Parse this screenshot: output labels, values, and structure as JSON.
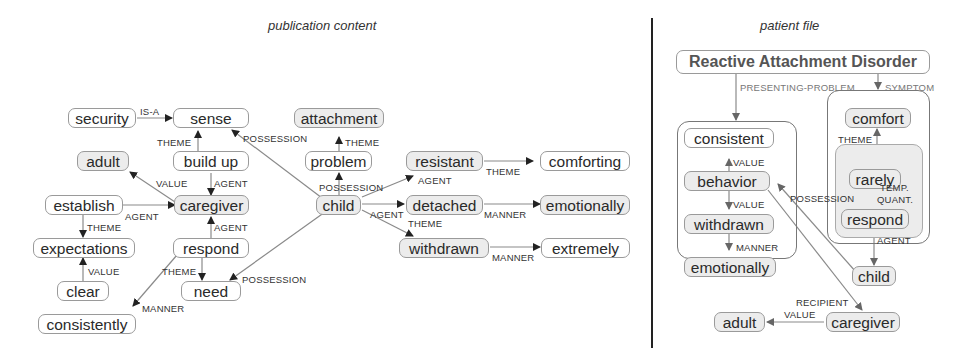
{
  "titles": {
    "left": "publication content",
    "right": "patient file"
  },
  "left_graph": {
    "nodes": {
      "security": "security",
      "sense": "sense",
      "attachment": "attachment",
      "adult": "adult",
      "build_up": "build up",
      "problem": "problem",
      "establish": "establish",
      "caregiver": "caregiver",
      "child": "child",
      "resistant": "resistant",
      "comforting": "comforting",
      "detached": "detached",
      "emotionally": "emotionally",
      "withdrawn": "withdrawn",
      "extremely": "extremely",
      "expectations": "expectations",
      "respond": "respond",
      "clear": "clear",
      "need": "need",
      "consistently": "consistently"
    },
    "edges": [
      {
        "from": "security",
        "to": "sense",
        "label": "IS-A"
      },
      {
        "from": "build_up",
        "to": "sense",
        "label": "THEME"
      },
      {
        "from": "child",
        "to": "sense",
        "label": "POSSESSION"
      },
      {
        "from": "problem",
        "to": "attachment",
        "label": "THEME"
      },
      {
        "from": "caregiver",
        "to": "adult",
        "label": "VALUE"
      },
      {
        "from": "build_up",
        "to": "caregiver",
        "label": "AGENT"
      },
      {
        "from": "child",
        "to": "problem",
        "label": "POSSESSION"
      },
      {
        "from": "establish",
        "to": "caregiver",
        "label": "AGENT"
      },
      {
        "from": "respond",
        "to": "caregiver",
        "label": "AGENT"
      },
      {
        "from": "child",
        "to": "resistant",
        "label": "AGENT"
      },
      {
        "from": "resistant",
        "to": "comforting",
        "label": "THEME"
      },
      {
        "from": "child",
        "to": "detached",
        "label": "AGENT"
      },
      {
        "from": "detached",
        "to": "emotionally",
        "label": "MANNER"
      },
      {
        "from": "child",
        "to": "withdrawn",
        "label": "THEME"
      },
      {
        "from": "withdrawn",
        "to": "extremely",
        "label": "MANNER"
      },
      {
        "from": "establish",
        "to": "expectations",
        "label": "THEME"
      },
      {
        "from": "clear",
        "to": "expectations",
        "label": "VALUE"
      },
      {
        "from": "respond",
        "to": "need",
        "label": "THEME"
      },
      {
        "from": "child",
        "to": "need",
        "label": "POSSESSION"
      },
      {
        "from": "respond",
        "to": "consistently",
        "label": "MANNER"
      }
    ]
  },
  "right_graph": {
    "nodes": {
      "rad": "Reactive Attachment Disorder",
      "consistent": "consistent",
      "behavior": "behavior",
      "withdrawn": "withdrawn",
      "emotionally": "emotionally",
      "comfort": "comfort",
      "rarely": "rarely",
      "respond": "respond",
      "child": "child",
      "adult": "adult",
      "caregiver": "caregiver"
    },
    "edges": [
      {
        "from": "rad",
        "to": "presenting_group",
        "label": "PRESENTING-PROBLEM"
      },
      {
        "from": "rad",
        "to": "symptom_group",
        "label": "SYMPTOM"
      },
      {
        "from": "behavior",
        "to": "consistent",
        "label": "VALUE"
      },
      {
        "from": "behavior",
        "to": "withdrawn",
        "label": "VALUE"
      },
      {
        "from": "withdrawn",
        "to": "emotionally",
        "label": "MANNER"
      },
      {
        "from": "rarely_group",
        "to": "comfort",
        "label": "THEME"
      },
      {
        "from": "respond",
        "to": "rarely",
        "label": "TEMP. QUANT."
      },
      {
        "from": "respond",
        "to": "child",
        "label": "AGENT"
      },
      {
        "from": "child",
        "to": "behavior",
        "label": "POSSESSION"
      },
      {
        "from": "behavior",
        "to": "caregiver",
        "label": "RECIPIENT"
      },
      {
        "from": "caregiver",
        "to": "adult",
        "label": "VALUE"
      }
    ],
    "edge_labels": {
      "presenting_problem": "PRESENTING-PROBLEM",
      "symptom": "SYMPTOM",
      "value1": "VALUE",
      "value2": "VALUE",
      "manner": "MANNER",
      "theme": "THEME",
      "temp": "TEMP.",
      "quant": "QUANT.",
      "agent": "AGENT",
      "possession": "POSSESSION",
      "recipient": "RECIPIENT",
      "value3": "VALUE"
    }
  },
  "left_labels": {
    "isa": "IS-A",
    "theme_bu": "THEME",
    "possession_sense": "POSSESSION",
    "theme_att": "THEME",
    "value_adult": "VALUE",
    "agent_bu": "AGENT",
    "possession_prob": "POSSESSION",
    "agent_est": "AGENT",
    "theme_est": "THEME",
    "agent_resp": "AGENT",
    "agent_res": "AGENT",
    "theme_comf": "THEME",
    "agent_det": "AGENT",
    "theme_wd": "THEME",
    "manner_det": "MANNER",
    "manner_wd": "MANNER",
    "value_clear": "VALUE",
    "theme_need": "THEME",
    "possession_need": "POSSESSION",
    "manner_cons": "MANNER"
  }
}
